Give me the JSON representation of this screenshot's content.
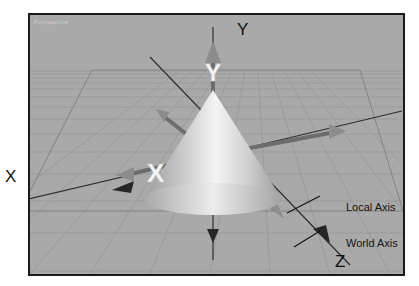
{
  "figure": {
    "background_color": "#ffffff",
    "border_color": "#1a1a1a"
  },
  "viewport": {
    "label": "Perspective",
    "background_color": "#a9a9a9",
    "grid_color": "#8f8f8f",
    "horizon_y": 68
  },
  "scene": {
    "object": {
      "name": "cone",
      "fill_light": "#f2f2f2",
      "fill_dark": "#9a9a9a"
    },
    "world_axes": {
      "color": "#2b2b2b",
      "labels": [
        {
          "id": "x",
          "text": "X"
        },
        {
          "id": "y",
          "text": "Y"
        },
        {
          "id": "z",
          "text": "Z"
        }
      ]
    },
    "local_axes": {
      "color": "#6f6f6f",
      "highlight_color": "#f4f4f4",
      "glyphs": [
        {
          "id": "x",
          "text": "X"
        },
        {
          "id": "y",
          "text": "Y"
        }
      ]
    }
  },
  "annotations": [
    {
      "id": "local-axis",
      "text": "Local Axis"
    },
    {
      "id": "world-axis",
      "text": "World Axis"
    }
  ]
}
